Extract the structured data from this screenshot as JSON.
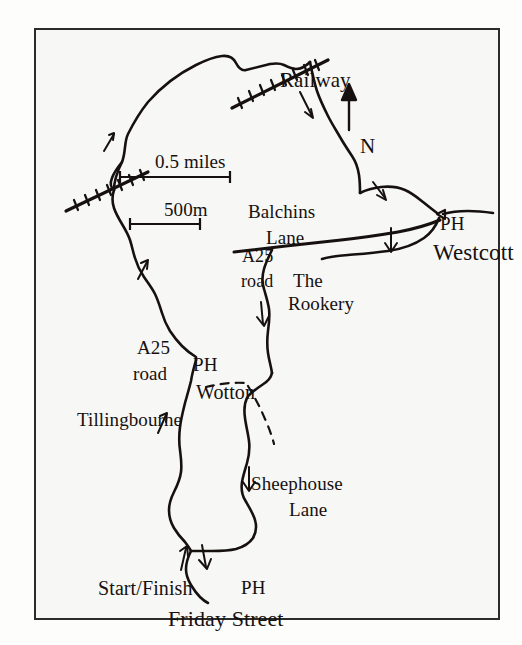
{
  "map": {
    "title": "Friday Street circular walk route map",
    "style": {
      "page_background": "#fdfdfc",
      "frame_background": "#f7f7f5",
      "frame_border_color": "#2b2b2b",
      "ink_color": "#16110f"
    },
    "scale_bars": [
      {
        "label": "0.5 miles",
        "bar_length_px": 110
      },
      {
        "label": "500m",
        "bar_length_px": 70
      }
    ],
    "compass": {
      "label": "N",
      "direction": "up"
    },
    "labels": [
      {
        "id": "railway",
        "text": "Railway",
        "kind": "feature"
      },
      {
        "id": "north",
        "text": "N",
        "kind": "compass"
      },
      {
        "id": "half_mile",
        "text": "0.5 miles",
        "kind": "scale"
      },
      {
        "id": "five_hundred_m",
        "text": "500m",
        "kind": "scale"
      },
      {
        "id": "balchins",
        "text": "Balchins",
        "kind": "place"
      },
      {
        "id": "lane_1",
        "text": "Lane",
        "kind": "place"
      },
      {
        "id": "a25_upper",
        "text": "A25",
        "kind": "road"
      },
      {
        "id": "road_upper",
        "text": "road",
        "kind": "road"
      },
      {
        "id": "ph_westcott",
        "text": "PH",
        "kind": "pub"
      },
      {
        "id": "westcott",
        "text": "Westcott",
        "kind": "place"
      },
      {
        "id": "the",
        "text": "The",
        "kind": "place"
      },
      {
        "id": "rookery",
        "text": "Rookery",
        "kind": "place"
      },
      {
        "id": "a25_lower",
        "text": "A25",
        "kind": "road"
      },
      {
        "id": "road_lower",
        "text": "road",
        "kind": "road"
      },
      {
        "id": "ph_wotton",
        "text": "PH",
        "kind": "pub"
      },
      {
        "id": "wotton",
        "text": "Wotton",
        "kind": "place"
      },
      {
        "id": "tillingbourne",
        "text": "Tillingbourne",
        "kind": "river"
      },
      {
        "id": "sheephouse",
        "text": "Sheephouse",
        "kind": "place"
      },
      {
        "id": "lane_2",
        "text": "Lane",
        "kind": "place"
      },
      {
        "id": "start_finish",
        "text": "Start/Finish",
        "kind": "marker"
      },
      {
        "id": "ph_start",
        "text": "PH",
        "kind": "pub"
      },
      {
        "id": "friday_street",
        "text": "Friday Street",
        "kind": "place"
      }
    ]
  }
}
